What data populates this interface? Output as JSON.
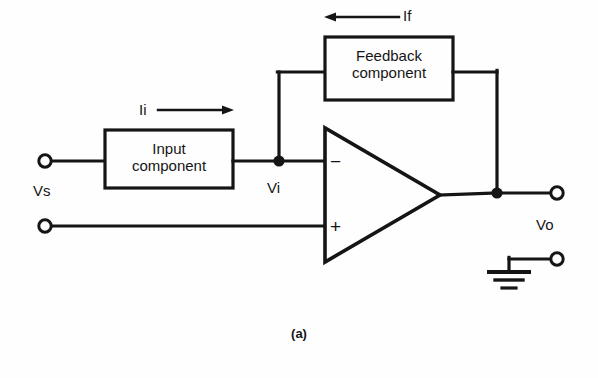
{
  "figure": {
    "caption": "(a)"
  },
  "blocks": [
    {
      "id": "input-component",
      "label": "Input\ncomponent",
      "x": 105,
      "y": 130,
      "w": 128,
      "h": 58
    },
    {
      "id": "feedback-component",
      "label": "Feedback\ncomponent",
      "x": 325,
      "y": 37,
      "w": 128,
      "h": 63
    }
  ],
  "labels": {
    "vs": "Vs",
    "vi": "Vi",
    "vo": "Vo",
    "current_input": "Ii",
    "current_feedback": "If",
    "inverting_input": "−",
    "noninverting_input": "+"
  },
  "terminals": [
    {
      "id": "source-positive-terminal",
      "label_ref": "vs",
      "x": 44,
      "y": 161
    },
    {
      "id": "source-negative-terminal",
      "label_ref": "vs",
      "x": 44,
      "y": 226
    },
    {
      "id": "output-terminal",
      "label_ref": "vo",
      "x": 557,
      "y": 193
    },
    {
      "id": "ground-terminal",
      "label_ref": "",
      "x": 557,
      "y": 259
    }
  ],
  "nodes": [
    {
      "id": "inverting-node",
      "label_ref": "vi",
      "x": 279,
      "y": 161
    },
    {
      "id": "output-node",
      "label_ref": "vo",
      "x": 497,
      "y": 193
    }
  ],
  "opamp": {
    "id": "operational-amplifier",
    "left_x": 325,
    "top_y": 128,
    "bottom_y": 262,
    "apex_x": 440,
    "apex_y": 195
  },
  "current_arrows": [
    {
      "id": "input-current-arrow",
      "direction": "right",
      "label_ref": "current_input",
      "x1": 158,
      "x2": 232,
      "y": 110
    },
    {
      "id": "feedback-current-arrow",
      "direction": "left",
      "label_ref": "current_feedback",
      "x1": 395,
      "x2": 325,
      "y": 17
    }
  ],
  "ground": {
    "id": "ground-symbol",
    "x": 509,
    "y": 272,
    "bars": 3
  },
  "colors": {
    "line": "#151515",
    "background": "#fefefe",
    "text": "#151515"
  }
}
